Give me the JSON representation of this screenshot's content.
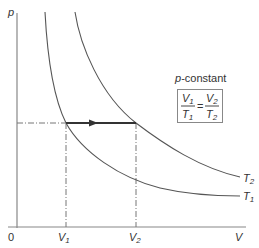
{
  "diagram": {
    "title_label": "p-constant",
    "title_italic": "p",
    "title_rest": "-constant",
    "axes": {
      "y_label": "p",
      "x_label": "V",
      "origin_label": "0"
    },
    "x_ticks": [
      {
        "label": "V",
        "sub": "1"
      },
      {
        "label": "V",
        "sub": "2"
      }
    ],
    "curves": [
      {
        "label": "T",
        "sub": "1",
        "name": "isotherm-T1"
      },
      {
        "label": "T",
        "sub": "2",
        "name": "isotherm-T2"
      }
    ],
    "formula": {
      "lhs_num": "V",
      "lhs_num_sub": "1",
      "lhs_den": "T",
      "lhs_den_sub": "1",
      "equals": "=",
      "rhs_num": "V",
      "rhs_num_sub": "2",
      "rhs_den": "T",
      "rhs_den_sub": "2"
    },
    "colors": {
      "axis": "#777777",
      "curve": "#555555",
      "process_line": "#333333",
      "dashdot": "#777777",
      "box_border": "#888888",
      "text": "#333333"
    }
  }
}
